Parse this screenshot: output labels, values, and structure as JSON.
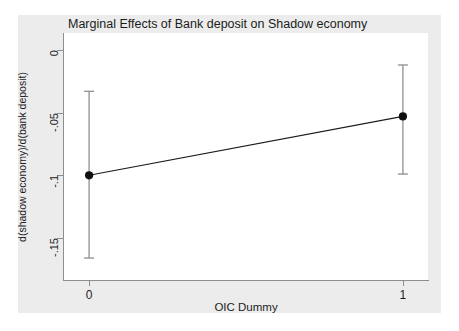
{
  "page_header": {
    "running_head": "",
    "page_number": ""
  },
  "chart_data": {
    "type": "line",
    "title": "Marginal Effects of Bank deposit on Shadow economy",
    "xlabel": "OIC Dummy",
    "ylabel": "d(shadow economy)/d(bank deposit)",
    "x": [
      0,
      1
    ],
    "xticklabels": [
      "0",
      "1"
    ],
    "xlim": [
      -0.08,
      1.08
    ],
    "values": [
      -0.1,
      -0.053
    ],
    "errors_low": [
      -0.166,
      -0.099
    ],
    "errors_high": [
      -0.033,
      -0.012
    ],
    "yticks": [
      0,
      -0.05,
      -0.1,
      -0.15
    ],
    "yticklabels": [
      "0",
      "-.05",
      "-.1",
      "-.15"
    ],
    "ylim": [
      -0.1835,
      0.0135
    ],
    "grid": false,
    "legend": false,
    "marker": "filled-circle",
    "series_name": "Marginal effect"
  },
  "colors": {
    "graph_region": "#ececec",
    "plot_region": "#ffffff",
    "axis": "#8e8e8e",
    "line": "#1c1c1c",
    "marker": "#101010",
    "error_bar": "#8e8e8e",
    "text": "#1c1c1c"
  }
}
